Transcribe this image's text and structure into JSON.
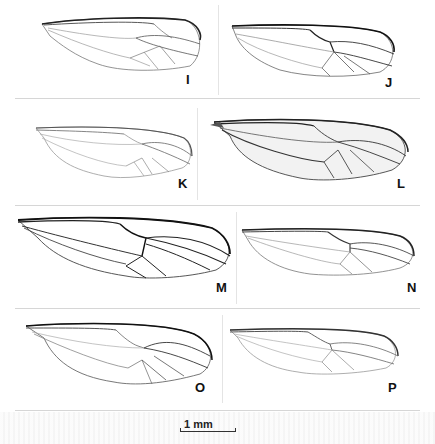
{
  "figure": {
    "panels": [
      {
        "id": "I",
        "label": "I"
      },
      {
        "id": "J",
        "label": "J"
      },
      {
        "id": "K",
        "label": "K"
      },
      {
        "id": "L",
        "label": "L"
      },
      {
        "id": "M",
        "label": "M"
      },
      {
        "id": "N",
        "label": "N"
      },
      {
        "id": "O",
        "label": "O"
      },
      {
        "id": "P",
        "label": "P"
      }
    ],
    "scale_bar": {
      "label": "1 mm"
    }
  }
}
